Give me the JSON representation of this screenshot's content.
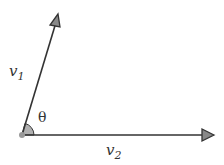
{
  "diagram": {
    "labels": {
      "v1": "v",
      "v1_sub": "1",
      "v2": "v",
      "v2_sub": "2",
      "theta": "θ"
    },
    "colors": {
      "stroke": "#333333",
      "arrowhead_fill": "#888888",
      "angle_fill": "#aaaaaa",
      "origin_dot": "#999999"
    }
  }
}
